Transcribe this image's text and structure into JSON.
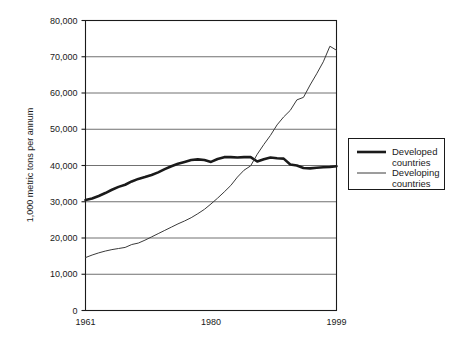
{
  "chart_data": {
    "type": "line",
    "title": "",
    "xlabel": "",
    "ylabel": "1,000 metric tons per annum",
    "xlim": [
      1961,
      1999
    ],
    "ylim": [
      0,
      80000
    ],
    "grid": true,
    "legend_position": "right",
    "y_ticks": [
      0,
      10000,
      20000,
      30000,
      40000,
      50000,
      60000,
      70000,
      80000
    ],
    "y_tick_labels": [
      "0",
      "10,000",
      "20,000",
      "30,000",
      "40,000",
      "50,000",
      "60,000",
      "70,000",
      "80,000"
    ],
    "x_ticks": [
      1961,
      1980,
      1999
    ],
    "x_tick_labels": [
      "1961",
      "1980",
      "1999"
    ],
    "x": [
      1961,
      1962,
      1963,
      1964,
      1965,
      1966,
      1967,
      1968,
      1969,
      1970,
      1971,
      1972,
      1973,
      1974,
      1975,
      1976,
      1977,
      1978,
      1979,
      1980,
      1981,
      1982,
      1983,
      1984,
      1985,
      1986,
      1987,
      1988,
      1989,
      1990,
      1991,
      1992,
      1993,
      1994,
      1995,
      1996,
      1997,
      1998,
      1999
    ],
    "series": [
      {
        "name": "Developed countries",
        "style": "thick",
        "color": "#1a1a1a",
        "width": 2.6,
        "values": [
          30500,
          30900,
          31600,
          32400,
          33300,
          34100,
          34700,
          35600,
          36300,
          36800,
          37400,
          38100,
          39000,
          39800,
          40500,
          41000,
          41500,
          41700,
          41500,
          41000,
          41800,
          42300,
          42300,
          42200,
          42300,
          42300,
          41100,
          41700,
          42200,
          42000,
          41900,
          40300,
          40000,
          39300,
          39200,
          39400,
          39500,
          39600,
          39800
        ]
      },
      {
        "name": "Developing countries",
        "style": "thin",
        "color": "#3a3a3a",
        "width": 1.0,
        "values": [
          14600,
          15300,
          15900,
          16400,
          16800,
          17100,
          17400,
          18200,
          18600,
          19400,
          20300,
          21200,
          22100,
          23000,
          23900,
          24700,
          25600,
          26700,
          27900,
          29400,
          31000,
          32700,
          34500,
          36800,
          38700,
          39900,
          43100,
          45800,
          48300,
          51200,
          53400,
          55200,
          58100,
          58800,
          62200,
          65300,
          68600,
          72900,
          71800
        ]
      }
    ]
  },
  "legend": {
    "items": [
      {
        "label_line1": "Developed",
        "label_line2": "countries"
      },
      {
        "label_line1": "Developing",
        "label_line2": "countries"
      }
    ]
  }
}
